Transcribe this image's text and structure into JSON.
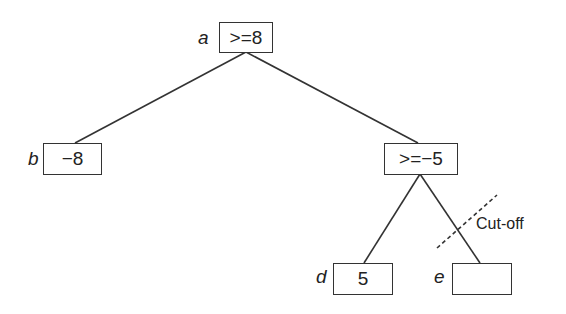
{
  "diagram": {
    "type": "game-tree alpha-beta pruning",
    "nodes": [
      {
        "id": "a",
        "label": "a",
        "value": ">=8"
      },
      {
        "id": "b",
        "label": "b",
        "value": "−8"
      },
      {
        "id": "c",
        "label": "",
        "value": ">=−5"
      },
      {
        "id": "d",
        "label": "d",
        "value": "5"
      },
      {
        "id": "e",
        "label": "e",
        "value": ""
      }
    ],
    "edges": [
      [
        "a",
        "b"
      ],
      [
        "a",
        "c"
      ],
      [
        "c",
        "d"
      ],
      [
        "c",
        "e"
      ]
    ],
    "annotation": "Cut-off"
  }
}
